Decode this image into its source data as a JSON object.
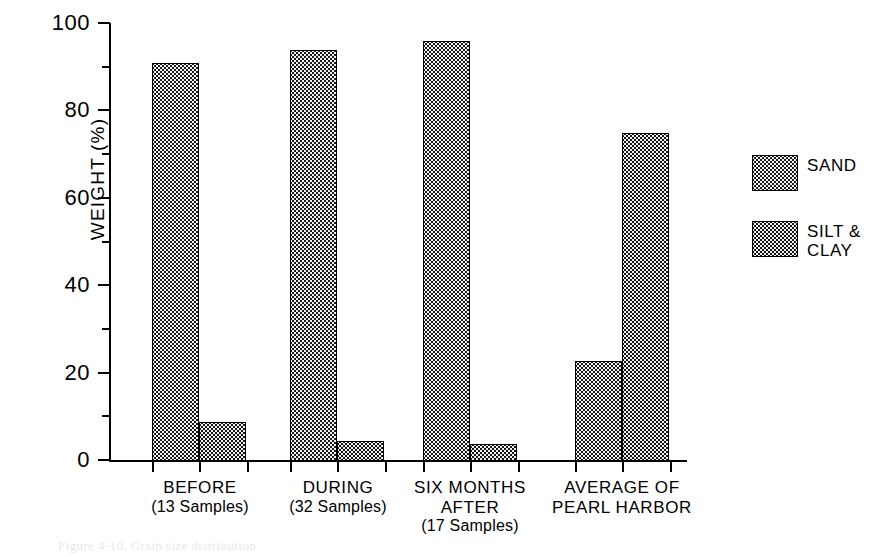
{
  "figure": {
    "caption_remnant": "Figure 4-10.  Grain size distribution",
    "background": "#ffffff",
    "ink_color": "#000000"
  },
  "axes": {
    "ylabel": "WEIGHT  (%)",
    "ytick_labels": [
      "0",
      "20",
      "40",
      "60",
      "80",
      "100"
    ],
    "ytick_values": [
      0,
      20,
      40,
      60,
      80,
      100
    ],
    "yminor_values": [
      10,
      30,
      50,
      70,
      90
    ],
    "ylim": [
      0,
      100
    ]
  },
  "legend": {
    "position": "right",
    "entries": [
      {
        "label": "SAND",
        "pattern": "light-stipple",
        "color": "#f2f2f2"
      },
      {
        "label": "SILT &\nCLAY",
        "pattern": "dark-stipple",
        "color": "#161616"
      }
    ]
  },
  "groups": [
    {
      "title": "BEFORE",
      "subtitle": "(13 Samples)"
    },
    {
      "title": "DURING",
      "subtitle": "(32 Samples)"
    },
    {
      "title": "SIX MONTHS\nAFTER",
      "subtitle": "(17 Samples)"
    },
    {
      "title": "AVERAGE OF\nPEARL HARBOR",
      "subtitle": ""
    }
  ],
  "chart_data": {
    "type": "bar",
    "title": "",
    "subtitle": "",
    "xlabel": "",
    "ylabel": "WEIGHT  (%)",
    "ylim": [
      0,
      100
    ],
    "grid": false,
    "legend_position": "right",
    "categories": [
      "BEFORE (13 Samples)",
      "DURING (32 Samples)",
      "SIX MONTHS AFTER (17 Samples)",
      "AVERAGE OF PEARL HARBOR"
    ],
    "series": [
      {
        "name": "SAND",
        "values": [
          91,
          94,
          96,
          23
        ]
      },
      {
        "name": "SILT & CLAY",
        "values": [
          9,
          4.5,
          4,
          75
        ]
      }
    ],
    "ytick_labels": [
      "0",
      "20",
      "40",
      "60",
      "80",
      "100"
    ],
    "annotations": []
  },
  "bar_geometry": {
    "groups": [
      {
        "sand_left": 42,
        "silt_left": 89
      },
      {
        "sand_left": 180,
        "silt_left": 227
      },
      {
        "sand_left": 313,
        "silt_left": 360
      },
      {
        "sand_left": 465,
        "silt_left": 512
      }
    ],
    "bar_width": 47
  },
  "xticks": [
    152,
    199,
    247,
    290,
    337,
    385,
    423,
    470,
    518,
    575,
    622,
    670
  ],
  "group_label_positions": [
    {
      "left": 110,
      "top": 478,
      "width": 180
    },
    {
      "left": 248,
      "top": 478,
      "width": 180
    },
    {
      "left": 380,
      "top": 478,
      "width": 180
    },
    {
      "left": 512,
      "top": 478,
      "width": 220
    }
  ]
}
